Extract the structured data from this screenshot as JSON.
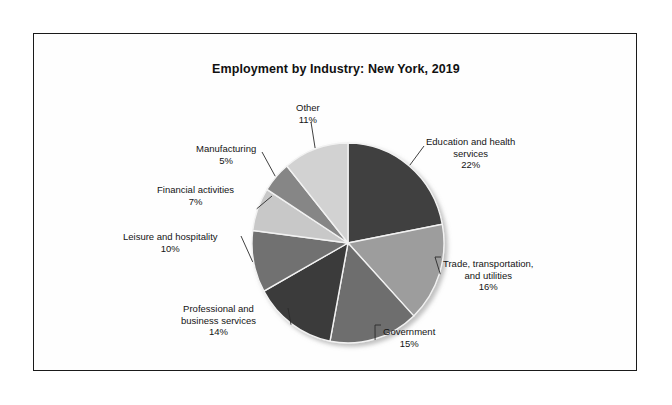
{
  "figure": {
    "title": "Employment by Industry: New York, 2019",
    "background": "#ffffff",
    "frame_color": "#1a1a1a"
  },
  "chart_data": {
    "type": "pie",
    "title": "Employment by Industry: New York, 2019",
    "xlabel": "",
    "ylabel": "",
    "units": "percent",
    "total": 100,
    "start_angle_deg": 0,
    "direction": "clockwise",
    "legend": "none, labels placed outside slices with leader lines",
    "grid": false,
    "categories": [
      "Education and health services",
      "Trade, transportation, and utilities",
      "Government",
      "Professional and business services",
      "Leisure and hospitality",
      "Financial activities",
      "Manufacturing",
      "Other"
    ],
    "values": [
      22,
      16,
      15,
      14,
      10,
      7,
      5,
      11
    ],
    "slices": [
      {
        "label": "Education and health services",
        "label_line1": "Education and health",
        "label_line2": "services",
        "value": 22,
        "pct_text": "22%",
        "color": "#3f3f3f"
      },
      {
        "label": "Trade, transportation, and utilities",
        "label_line1": "Trade, transportation,",
        "label_line2": "and utilities",
        "value": 16,
        "pct_text": "16%",
        "color": "#9d9d9d"
      },
      {
        "label": "Government",
        "label_line1": "Government",
        "label_line2": "",
        "value": 15,
        "pct_text": "15%",
        "color": "#6e6e6e"
      },
      {
        "label": "Professional and business services",
        "label_line1": "Professional and",
        "label_line2": "business services",
        "value": 14,
        "pct_text": "14%",
        "color": "#3a3a3a"
      },
      {
        "label": "Leisure and hospitality",
        "label_line1": "Leisure and hospitality",
        "label_line2": "",
        "value": 10,
        "pct_text": "10%",
        "color": "#717171"
      },
      {
        "label": "Financial activities",
        "label_line1": "Financial activities",
        "label_line2": "",
        "value": 7,
        "pct_text": "7%",
        "color": "#c8c8c8"
      },
      {
        "label": "Manufacturing",
        "label_line1": "Manufacturing",
        "label_line2": "",
        "value": 5,
        "pct_text": "5%",
        "color": "#868686"
      },
      {
        "label": "Other",
        "label_line1": "Other",
        "label_line2": "",
        "value": 11,
        "pct_text": "11%",
        "color": "#d2d2d2"
      }
    ]
  }
}
